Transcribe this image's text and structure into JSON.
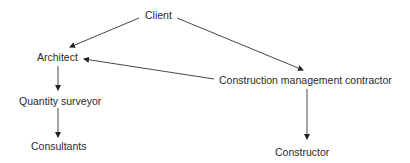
{
  "diagram": {
    "nodes": {
      "client": "Client",
      "architect": "Architect",
      "cmc": "Construction management contractor",
      "qs": "Quantity surveyor",
      "consultants": "Consultants",
      "constructor": "Constructor"
    },
    "edges": [
      {
        "from": "Client",
        "to": "Architect"
      },
      {
        "from": "Client",
        "to": "Construction management contractor"
      },
      {
        "from": "Construction management contractor",
        "to": "Architect"
      },
      {
        "from": "Architect",
        "to": "Quantity surveyor"
      },
      {
        "from": "Quantity surveyor",
        "to": "Consultants"
      },
      {
        "from": "Construction management contractor",
        "to": "Constructor"
      }
    ],
    "colors": {
      "line": "#333333",
      "text": "#2a2a2a",
      "background": "#ffffff"
    }
  }
}
